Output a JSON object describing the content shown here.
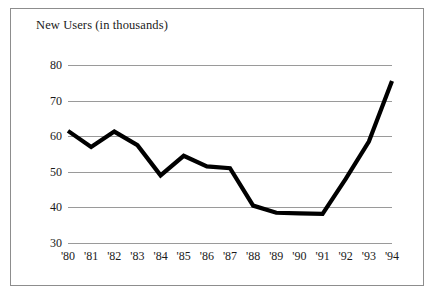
{
  "chart_data": {
    "type": "line",
    "title": "New Users (in thousands)",
    "xlabel": "",
    "ylabel": "",
    "categories": [
      "'80",
      "'81",
      "'82",
      "'83",
      "'84",
      "'85",
      "'86",
      "'87",
      "'88",
      "'89",
      "'90",
      "'91",
      "'92",
      "'93",
      "'94"
    ],
    "values": [
      61.5,
      57.0,
      61.3,
      57.5,
      49.0,
      54.5,
      51.5,
      51.0,
      40.5,
      38.5,
      38.3,
      38.2,
      48.0,
      58.5,
      75.5
    ],
    "series": [
      {
        "name": "New Users",
        "values": [
          61.5,
          57.0,
          61.3,
          57.5,
          49.0,
          54.5,
          51.5,
          51.0,
          40.5,
          38.5,
          38.3,
          38.2,
          48.0,
          58.5,
          75.5
        ]
      }
    ],
    "ylim": [
      30,
      80
    ],
    "yticks": [
      30,
      40,
      50,
      60,
      70,
      80
    ],
    "ytick_labels": [
      "30",
      "40",
      "50",
      "60",
      "70",
      "80"
    ],
    "grid": true,
    "legend": false,
    "line_color": "#000000",
    "grid_color": "#9a9a9a",
    "frame_color": "#8d8d8d"
  }
}
